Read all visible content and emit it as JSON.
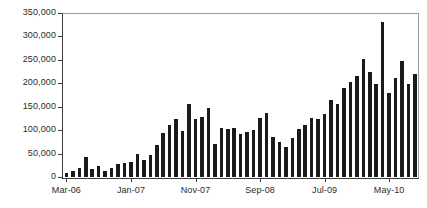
{
  "chart_data": {
    "type": "bar",
    "title": "",
    "subtitle": "",
    "xlabel": "",
    "ylabel": "",
    "ylim": [
      0,
      350000
    ],
    "y_ticks": [
      0,
      50000,
      100000,
      150000,
      200000,
      250000,
      300000,
      350000
    ],
    "y_tick_labels": [
      "0",
      "50,000",
      "100,000",
      "150,000",
      "200,000",
      "250,000",
      "300,000",
      "350,000"
    ],
    "grid": false,
    "legend": false,
    "legend_position": "none",
    "bar_color": "#1a1a1a",
    "axis_color": "#3b3b3b",
    "frame_color": "#9a9a9a",
    "x_tick_labels": [
      "Mar-06",
      "Jan-07",
      "Nov-07",
      "Sep-08",
      "Jul-09",
      "May-10"
    ],
    "x_tick_indices": [
      0,
      10,
      20,
      30,
      40,
      50
    ],
    "categories": [
      "Mar-06",
      "Apr-06",
      "May-06",
      "Jun-06",
      "Jul-06",
      "Aug-06",
      "Sep-06",
      "Oct-06",
      "Nov-06",
      "Dec-06",
      "Jan-07",
      "Feb-07",
      "Mar-07",
      "Apr-07",
      "May-07",
      "Jun-07",
      "Jul-07",
      "Aug-07",
      "Sep-07",
      "Oct-07",
      "Nov-07",
      "Dec-07",
      "Jan-08",
      "Feb-08",
      "Mar-08",
      "Apr-08",
      "May-08",
      "Jun-08",
      "Jul-08",
      "Aug-08",
      "Sep-08",
      "Oct-08",
      "Nov-08",
      "Dec-08",
      "Jan-09",
      "Feb-09",
      "Mar-09",
      "Apr-09",
      "May-09",
      "Jun-09",
      "Jul-09",
      "Aug-09",
      "Sep-09",
      "Oct-09",
      "Nov-09",
      "Dec-09",
      "Jan-10",
      "Feb-10",
      "Mar-10",
      "Apr-10",
      "May-10",
      "Jun-10",
      "Jul-10",
      "Aug-10",
      "Sep-10"
    ],
    "values": [
      8000,
      12000,
      20000,
      42000,
      18000,
      24000,
      13000,
      19000,
      28000,
      29000,
      33000,
      50000,
      37000,
      46000,
      68000,
      95000,
      111000,
      124000,
      98000,
      155000,
      124000,
      128000,
      148000,
      70000,
      105000,
      103000,
      104000,
      92000,
      97000,
      101000,
      125000,
      137000,
      85000,
      74000,
      64000,
      83000,
      102000,
      110000,
      125000,
      123000,
      134000,
      164000,
      155000,
      190000,
      203000,
      215000,
      251000,
      225000,
      198000,
      330000,
      180000,
      212000,
      247000,
      199000,
      220000
    ]
  }
}
